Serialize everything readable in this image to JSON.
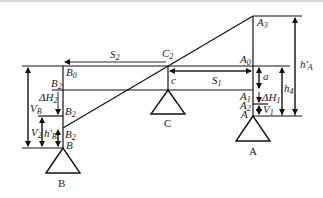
{
  "diagram": {
    "type": "three-point support elevation diagram",
    "supports": [
      {
        "id": "B",
        "label": "B"
      },
      {
        "id": "C",
        "label": "C"
      },
      {
        "id": "A",
        "label": "A"
      }
    ],
    "point_labels": {
      "A3": {
        "base": "A",
        "sub": "3"
      },
      "A0": {
        "base": "A",
        "sub": "0"
      },
      "A1": {
        "base": "A",
        "sub": "1"
      },
      "A2": {
        "base": "A",
        "sub": "2"
      },
      "A": {
        "base": "A",
        "sub": ""
      },
      "B0": {
        "base": "B",
        "sub": "0"
      },
      "B2_top": {
        "base": "B",
        "sub": "2"
      },
      "B2_mid": {
        "base": "B",
        "sub": "2"
      },
      "B2_low": {
        "base": "B",
        "sub": "2"
      },
      "B": {
        "base": "B",
        "sub": ""
      },
      "C2": {
        "base": "C",
        "sub": "2"
      },
      "c": {
        "base": "c",
        "sub": ""
      }
    },
    "dimensions": {
      "S2": {
        "base": "S",
        "sub": "2"
      },
      "S1": {
        "base": "S",
        "sub": "1"
      },
      "a": {
        "base": "a",
        "sub": ""
      },
      "dH1": {
        "base": "ΔH",
        "sub": "1"
      },
      "V1": {
        "base": "V",
        "sub": "1"
      },
      "h4": {
        "base": "h",
        "sub": "4"
      },
      "hA": {
        "base": "h'",
        "sub": "A"
      },
      "VB": {
        "base": "V",
        "sub": "B"
      },
      "dH2": {
        "base": "ΔH",
        "sub": "2"
      },
      "V2": {
        "base": "V",
        "sub": "2"
      },
      "hB": {
        "base": "h'",
        "sub": "B"
      }
    },
    "colors": {
      "line": "#111111",
      "text": "#222222",
      "background": "#ffffff"
    }
  }
}
